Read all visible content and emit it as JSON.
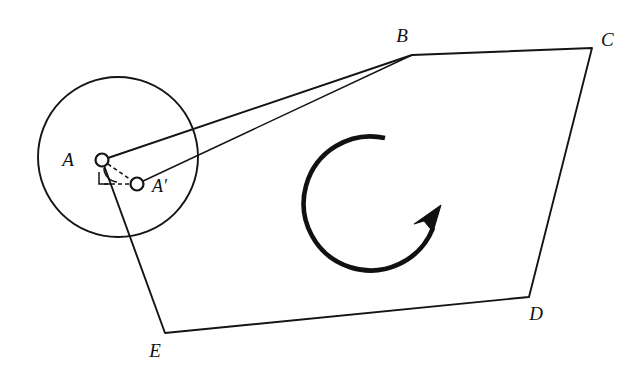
{
  "figure": {
    "background_color": "#ffffff",
    "stroke_color": "#141414",
    "width": 635,
    "height": 381
  },
  "polygon": {
    "name": "ABCDE",
    "vertices": [
      {
        "id": "A",
        "label": "A",
        "x": 102,
        "y": 160,
        "label_x": 68,
        "label_y": 166
      },
      {
        "id": "B",
        "label": "B",
        "x": 412,
        "y": 55,
        "label_x": 402,
        "label_y": 42
      },
      {
        "id": "C",
        "label": "C",
        "x": 592,
        "y": 48,
        "label_x": 601,
        "label_y": 46
      },
      {
        "id": "D",
        "label": "D",
        "x": 529,
        "y": 297,
        "label_x": 536,
        "label_y": 320
      },
      {
        "id": "E",
        "label": "E",
        "x": 165,
        "y": 333,
        "label_x": 155,
        "label_y": 357
      }
    ],
    "edge_path": "M 102 160 L 412 55 L 592 48 L 529 297 L 165 333 Z"
  },
  "image_point": {
    "id": "A-prime",
    "label": "A′",
    "x": 137,
    "y": 184,
    "label_x": 152,
    "label_y": 192
  },
  "rotation_circle": {
    "center_x": 118,
    "center_y": 157,
    "radius": 80
  },
  "construction": {
    "dashed_chord_label": "A to A-prime",
    "dashed_chord": "M 102 160 L 137 184",
    "dashed_horizontal": "M 104 184 L 131 184",
    "right_angle_mark": "M 99 172 L 99 184 L 110 184",
    "angle_arc": "M 104 168 A 14 14 0 0 0 117 182"
  },
  "rotation_arrow": {
    "center_x": 373,
    "center_y": 205,
    "radius": 67,
    "direction": "counterclockwise",
    "arc_path": "M 385 138 A 67 67 0 1 0 433 228",
    "arrowhead_points": "441 205 433 232 424 221 414 224"
  }
}
